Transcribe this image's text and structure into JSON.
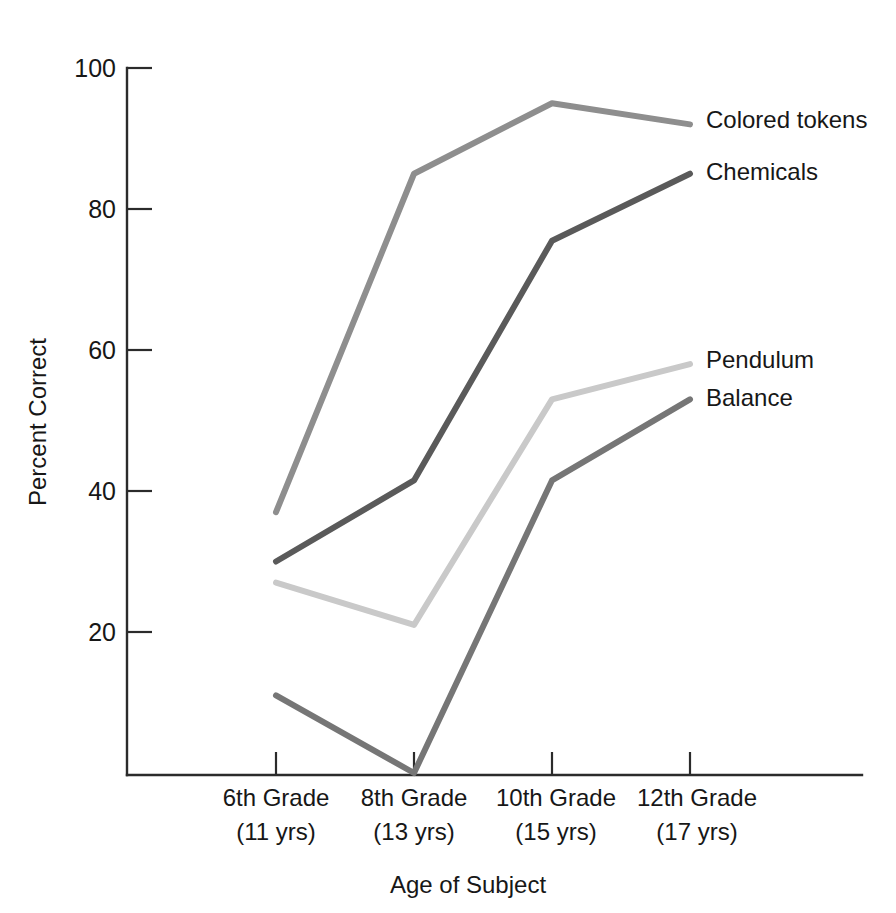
{
  "chart_data": {
    "type": "line",
    "title": "",
    "xlabel": "Age of Subject",
    "ylabel": "Percent Correct",
    "categories": [
      "6th Grade\n(11 yrs)",
      "8th Grade\n(13 yrs)",
      "10th Grade\n(15 yrs)",
      "12th Grade\n(17 yrs)"
    ],
    "category_lines": [
      {
        "grade": "6th Grade",
        "age": "(11 yrs)"
      },
      {
        "grade": "8th Grade",
        "age": "(13 yrs)"
      },
      {
        "grade": "10th Grade",
        "age": "(15 yrs)"
      },
      {
        "grade": "12th Grade",
        "age": "(17 yrs)"
      }
    ],
    "ylim": [
      0,
      100
    ],
    "yticks": [
      20,
      40,
      60,
      80,
      100
    ],
    "ytick_labels": [
      "20",
      "40",
      "60",
      "80",
      "100"
    ],
    "grid": false,
    "legend_position": "right-inline-labels",
    "series": [
      {
        "name": "Colored tokens",
        "color": "#8e8e8e",
        "values": [
          37,
          85,
          95,
          92
        ]
      },
      {
        "name": "Chemicals",
        "color": "#5a5a5a",
        "values": [
          30,
          41.5,
          75.5,
          85
        ]
      },
      {
        "name": "Pendulum",
        "color": "#c9c9c9",
        "values": [
          27,
          21,
          53,
          58
        ]
      },
      {
        "name": "Balance",
        "color": "#767676",
        "values": [
          11,
          0,
          41.5,
          53
        ]
      }
    ]
  },
  "axis": {
    "y_title": "Percent Correct",
    "x_title": "Age of Subject",
    "y_ticks": [
      "100",
      "80",
      "60",
      "40",
      "20"
    ]
  },
  "series_labels": [
    {
      "text": "Colored tokens"
    },
    {
      "text": "Chemicals"
    },
    {
      "text": "Pendulum"
    },
    {
      "text": "Balance"
    }
  ],
  "x_categories": [
    {
      "grade": "6th Grade",
      "age": "(11 yrs)"
    },
    {
      "grade": "8th Grade",
      "age": "(13 yrs)"
    },
    {
      "grade": "10th Grade",
      "age": "(15 yrs)"
    },
    {
      "grade": "12th Grade",
      "age": "(17 yrs)"
    }
  ],
  "colors": {
    "colored_tokens": "#8e8e8e",
    "chemicals": "#5a5a5a",
    "pendulum": "#c9c9c9",
    "balance": "#767676",
    "axis": "#2b2b2b",
    "text": "#171717",
    "background": "#ffffff"
  }
}
